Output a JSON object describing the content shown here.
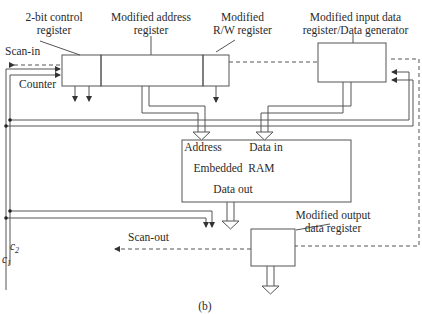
{
  "diagram": {
    "caption": "(b)",
    "blocks": {
      "control_register": {
        "label_line1": "2-bit control",
        "label_line2": "register"
      },
      "address_register": {
        "label_line1": "Modified address",
        "label_line2": "register"
      },
      "rw_register": {
        "label_line1": "Modified",
        "label_line2": "R/W register"
      },
      "input_register": {
        "label_line1": "Modified input data",
        "label_line2": "register/Data generator"
      },
      "embedded_ram": {
        "address_port": "Address",
        "data_in_port": "Data in",
        "title": "Embedded  RAM",
        "data_out_port": "Data out"
      },
      "output_register": {
        "label_line1": "Modified output",
        "label_line2": "data register"
      }
    },
    "signals": {
      "scan_in": "Scan-in",
      "scan_out": "Scan-out",
      "counter": "Counter",
      "c1": {
        "base": "c",
        "sub": "1"
      },
      "c2": {
        "base": "c",
        "sub": "2"
      }
    },
    "colors": {
      "line": "#555555",
      "text": "#2a2a2a",
      "background": "#ffffff"
    }
  }
}
